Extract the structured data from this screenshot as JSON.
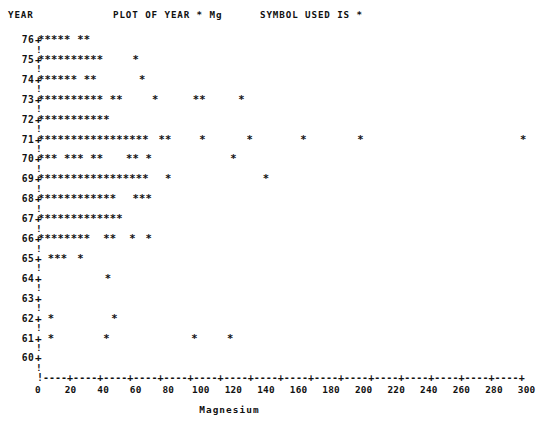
{
  "header": {
    "year_label": "YEAR",
    "title": "PLOT OF YEAR * Mg",
    "symbol_note": "SYMBOL USED IS *"
  },
  "axis": {
    "x_title": "Magnesium",
    "x_min": 0,
    "x_max": 315,
    "x_ticks": [
      0,
      20,
      40,
      60,
      80,
      100,
      120,
      140,
      160,
      180,
      200,
      220,
      240,
      260,
      280,
      300
    ],
    "x_tick_labels": [
      "0",
      "20",
      "40",
      "60",
      "80",
      "100",
      "120",
      "140",
      "160",
      "180",
      "200",
      "220",
      "240",
      "260",
      "280",
      "300"
    ],
    "axis_line_pattern": "!----+----+----+----+----+----+----+----+----+----+----+----+----+----+----+----+",
    "y_tick_glyph": "!",
    "origin_glyph": "+",
    "marker_glyph": "*",
    "y_min": 60,
    "y_max": 76,
    "y_labels": [
      "76",
      "75",
      "74",
      "73",
      "72",
      "71",
      "70",
      "69",
      "68",
      "67",
      "66",
      "65",
      "64",
      "63",
      "62",
      "61",
      "60"
    ]
  },
  "chart_data": {
    "type": "scatter",
    "title": "PLOT OF YEAR * Mg",
    "xlabel": "Magnesium",
    "ylabel": "YEAR",
    "xlim": [
      0,
      315
    ],
    "ylim": [
      60,
      76
    ],
    "grid": false,
    "legend": "SYMBOL USED IS *",
    "marker": "*",
    "note": "Each row is one YEAR; values are Magnesium readings plotted as overstruck asterisks.",
    "rows": [
      {
        "year": "76",
        "values": [
          2,
          6,
          10,
          14,
          18,
          26,
          30
        ]
      },
      {
        "year": "75",
        "values": [
          2,
          6,
          10,
          14,
          18,
          22,
          26,
          30,
          34,
          38,
          60
        ]
      },
      {
        "year": "74",
        "values": [
          2,
          6,
          10,
          14,
          18,
          22,
          30,
          34,
          64
        ]
      },
      {
        "year": "73",
        "values": [
          2,
          6,
          10,
          14,
          18,
          22,
          26,
          30,
          34,
          38,
          46,
          50,
          72,
          97,
          101,
          125
        ]
      },
      {
        "year": "72",
        "values": [
          2,
          6,
          10,
          14,
          18,
          22,
          26,
          30,
          34,
          38,
          42
        ]
      },
      {
        "year": "71",
        "values": [
          2,
          6,
          10,
          14,
          18,
          22,
          26,
          30,
          34,
          38,
          42,
          46,
          50,
          54,
          58,
          62,
          66,
          76,
          80,
          101,
          130,
          163,
          198,
          298
        ]
      },
      {
        "year": "70",
        "values": [
          2,
          6,
          10,
          18,
          22,
          26,
          34,
          38,
          56,
          60,
          68,
          120
        ]
      },
      {
        "year": "69",
        "values": [
          2,
          6,
          10,
          14,
          18,
          22,
          26,
          30,
          34,
          38,
          42,
          46,
          50,
          54,
          58,
          62,
          66,
          80,
          140
        ]
      },
      {
        "year": "68",
        "values": [
          2,
          6,
          10,
          14,
          18,
          22,
          26,
          30,
          34,
          38,
          42,
          46,
          60,
          64,
          68
        ]
      },
      {
        "year": "67",
        "values": [
          2,
          6,
          10,
          14,
          18,
          22,
          26,
          30,
          34,
          38,
          42,
          46,
          50
        ]
      },
      {
        "year": "66",
        "values": [
          2,
          6,
          10,
          14,
          18,
          22,
          26,
          30,
          42,
          46,
          58,
          68
        ]
      },
      {
        "year": "65",
        "values": [
          8,
          12,
          16,
          26
        ]
      },
      {
        "year": "64",
        "values": [
          43
        ]
      },
      {
        "year": "63",
        "values": []
      },
      {
        "year": "62",
        "values": [
          8,
          47
        ]
      },
      {
        "year": "61",
        "values": [
          8,
          42,
          96,
          118
        ]
      },
      {
        "year": "60",
        "values": []
      }
    ]
  }
}
